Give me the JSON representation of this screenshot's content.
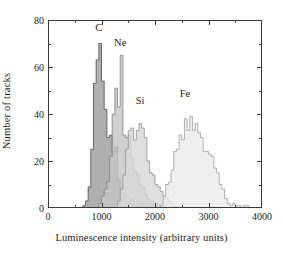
{
  "chart_data": {
    "type": "bar",
    "subtype": "overlaid-step-histogram",
    "title": "",
    "xlabel": "Luminescence intensity (arbitrary units)",
    "ylabel": "Number of tracks",
    "xlim": [
      0,
      4000
    ],
    "ylim": [
      0,
      80
    ],
    "x_major_ticks": [
      0,
      1000,
      2000,
      3000,
      4000
    ],
    "x_minor_interval": 500,
    "y_major_ticks": [
      0,
      20,
      40,
      60,
      80
    ],
    "y_minor_interval": 10,
    "grid": false,
    "legend": "inline-annotations",
    "bin_width": 50,
    "annotations": [
      {
        "text": "C",
        "x": 950,
        "y": 76
      },
      {
        "text": "Ne",
        "x": 1350,
        "y": 70
      },
      {
        "text": "Si",
        "x": 1720,
        "y": 45
      },
      {
        "text": "Fe",
        "x": 2560,
        "y": 48
      }
    ],
    "series": [
      {
        "name": "C",
        "fill": "#9e9e9e",
        "stroke": "#5a5a5a",
        "bins": [
          600,
          650,
          700,
          750,
          800,
          850,
          900,
          950,
          1000,
          1050,
          1100,
          1150,
          1200,
          1250,
          1300,
          1350,
          1400,
          1450,
          1500,
          1550,
          1600,
          1650,
          1700,
          1750,
          1800,
          1850,
          1900,
          1950,
          2000,
          2050,
          2100,
          2150,
          2200
        ],
        "values": [
          0,
          1,
          3,
          9,
          25,
          53,
          63,
          70,
          54,
          42,
          30,
          31,
          24,
          26,
          12,
          8,
          6,
          5,
          4,
          4,
          3,
          3,
          3,
          2,
          2,
          2,
          2,
          1,
          1,
          1,
          1,
          0,
          0
        ]
      },
      {
        "name": "Ne",
        "fill": "#c4c4c4",
        "stroke": "#8a8a8a",
        "bins": [
          900,
          950,
          1000,
          1050,
          1100,
          1150,
          1200,
          1250,
          1300,
          1350,
          1400,
          1450,
          1500,
          1550,
          1600,
          1650,
          1700,
          1750,
          1800,
          1850,
          1900,
          1950,
          2000,
          2050,
          2100,
          2150,
          2200,
          2250
        ],
        "values": [
          0,
          2,
          5,
          8,
          11,
          22,
          40,
          51,
          43,
          65,
          31,
          30,
          31,
          21,
          16,
          14,
          10,
          9,
          6,
          4,
          3,
          2,
          2,
          1,
          1,
          1,
          0,
          0
        ]
      },
      {
        "name": "Si",
        "fill": "#d8d8d8",
        "stroke": "#9c9c9c",
        "bins": [
          1250,
          1300,
          1350,
          1400,
          1450,
          1500,
          1550,
          1600,
          1650,
          1700,
          1750,
          1800,
          1850,
          1900,
          1950,
          2000,
          2050,
          2100,
          2150,
          2200,
          2250,
          2300,
          2350,
          2400
        ],
        "values": [
          0,
          3,
          8,
          14,
          25,
          33,
          34,
          29,
          33,
          36,
          34,
          30,
          20,
          15,
          14,
          10,
          9,
          7,
          5,
          4,
          3,
          2,
          1,
          0
        ]
      },
      {
        "name": "Fe",
        "fill": "#ececec",
        "stroke": "#a8a8a8",
        "bins": [
          2050,
          2100,
          2150,
          2200,
          2250,
          2300,
          2350,
          2400,
          2450,
          2500,
          2550,
          2600,
          2650,
          2700,
          2750,
          2800,
          2850,
          2900,
          2950,
          3000,
          3050,
          3100,
          3150,
          3200,
          3250,
          3300,
          3350,
          3400,
          3450,
          3500,
          3550,
          3600,
          3650,
          3700,
          3750,
          3800
        ],
        "values": [
          0,
          1,
          5,
          10,
          11,
          16,
          24,
          25,
          31,
          29,
          38,
          33,
          39,
          33,
          36,
          32,
          30,
          24,
          24,
          23,
          22,
          17,
          15,
          10,
          8,
          4,
          2,
          1,
          2,
          1,
          1,
          0,
          1,
          1,
          0,
          0
        ]
      }
    ]
  }
}
